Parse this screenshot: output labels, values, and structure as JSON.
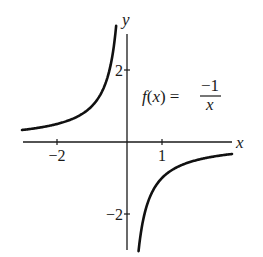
{
  "chart_data": {
    "type": "line",
    "title": "",
    "function_label": {
      "lhs": "f(x) =",
      "numerator": "−1",
      "denominator": "x"
    },
    "xlabel": "x",
    "ylabel": "y",
    "x_ticks": [
      {
        "value": -2,
        "label": "−2"
      },
      {
        "value": 1,
        "label": "1"
      }
    ],
    "y_ticks": [
      {
        "value": 2,
        "label": "2"
      },
      {
        "value": -2,
        "label": "−2"
      }
    ],
    "xlim": [
      -3,
      3
    ],
    "ylim": [
      -3,
      3
    ],
    "grid": false,
    "legend": null,
    "series": [
      {
        "name": "f(x) = -1/x (x < 0)",
        "x": [
          -3,
          -2.5,
          -2,
          -1.5,
          -1,
          -0.75,
          -0.5,
          -0.4,
          -0.31
        ],
        "y": [
          0.333,
          0.4,
          0.5,
          0.667,
          1,
          1.333,
          2,
          2.5,
          3.2
        ]
      },
      {
        "name": "f(x) = -1/x (x > 0)",
        "x": [
          0.33,
          0.4,
          0.5,
          0.75,
          1,
          1.5,
          2,
          2.5,
          3
        ],
        "y": [
          -3.0,
          -2.5,
          -2,
          -1.333,
          -1,
          -0.667,
          -0.5,
          -0.4,
          -0.333
        ]
      }
    ],
    "colors": {
      "axis": "#1a1a1a",
      "curve": "#111111"
    }
  }
}
